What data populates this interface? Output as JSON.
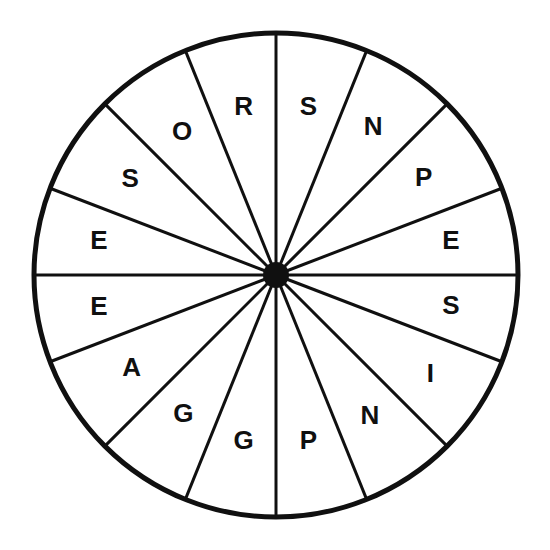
{
  "figure": {
    "name": "lettered-spinner-wheel",
    "background_color": "#ffffff",
    "stroke_color": "#101010",
    "hub_color": "#101010",
    "rim_stroke_width": 5,
    "spoke_stroke_width": 3,
    "center_x": 276,
    "center_y": 275,
    "radius": 242,
    "hub_radius": 13,
    "sector_count": 16
  },
  "chart_data": {
    "type": "pie",
    "title": "",
    "xlabel": "",
    "ylabel": "",
    "legend": "none",
    "grid": false,
    "categories": [
      "S",
      "N",
      "P",
      "E",
      "S",
      "I",
      "N",
      "P",
      "G",
      "G",
      "A",
      "E",
      "E",
      "S",
      "O",
      "R"
    ],
    "values": [
      22,
      23,
      24,
      21,
      21,
      24,
      23,
      22,
      22,
      23,
      24,
      21,
      21,
      24,
      23,
      22
    ],
    "unit": "degrees",
    "start_angle_deg": -90,
    "direction": "clockwise",
    "sectors": [
      {
        "index": 0,
        "label": "S",
        "start_deg": -90,
        "end_deg": -68,
        "label_radius": 170
      },
      {
        "index": 1,
        "label": "N",
        "start_deg": -68,
        "end_deg": -45,
        "label_radius": 176
      },
      {
        "index": 2,
        "label": "P",
        "start_deg": -45,
        "end_deg": -21,
        "label_radius": 176
      },
      {
        "index": 3,
        "label": "E",
        "start_deg": -21,
        "end_deg": 0,
        "label_radius": 178
      },
      {
        "index": 4,
        "label": "S",
        "start_deg": 0,
        "end_deg": 21,
        "label_radius": 178
      },
      {
        "index": 5,
        "label": "I",
        "start_deg": 21,
        "end_deg": 45,
        "label_radius": 184
      },
      {
        "index": 6,
        "label": "N",
        "start_deg": 45,
        "end_deg": 68,
        "label_radius": 170
      },
      {
        "index": 7,
        "label": "P",
        "start_deg": 68,
        "end_deg": 90,
        "label_radius": 170
      },
      {
        "index": 8,
        "label": "G",
        "start_deg": 90,
        "end_deg": 112,
        "label_radius": 170
      },
      {
        "index": 9,
        "label": "G",
        "start_deg": 112,
        "end_deg": 135,
        "label_radius": 168
      },
      {
        "index": 10,
        "label": "A",
        "start_deg": 135,
        "end_deg": 159,
        "label_radius": 172
      },
      {
        "index": 11,
        "label": "E",
        "start_deg": 159,
        "end_deg": 180,
        "label_radius": 180
      },
      {
        "index": 12,
        "label": "E",
        "start_deg": 180,
        "end_deg": 201,
        "label_radius": 180
      },
      {
        "index": 13,
        "label": "S",
        "start_deg": 201,
        "end_deg": 225,
        "label_radius": 174
      },
      {
        "index": 14,
        "label": "O",
        "start_deg": 225,
        "end_deg": 248,
        "label_radius": 170
      },
      {
        "index": 15,
        "label": "R",
        "start_deg": 248,
        "end_deg": 270,
        "label_radius": 170
      }
    ]
  },
  "accessibility": {
    "hub_name": "center-hub",
    "rim_name": "wheel-rim"
  }
}
